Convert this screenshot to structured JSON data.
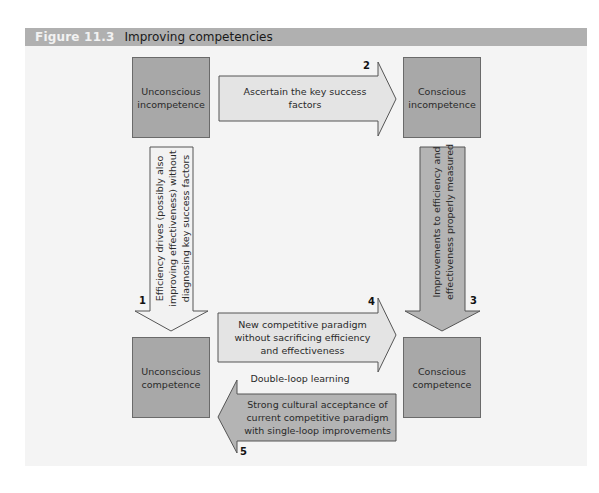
{
  "figure": {
    "number": "Figure 11.3",
    "title": "Improving competencies"
  },
  "boxes": {
    "unconscious_incompetence": "Unconscious incompetence",
    "conscious_incompetence": "Conscious incompetence",
    "unconscious_competence": "Unconscious competence",
    "conscious_competence": "Conscious competence"
  },
  "arrows": [
    {
      "number": "1",
      "label": "Efficiency drives (possibly also improving effectiveness) without diagnosing key success factors",
      "direction": "down"
    },
    {
      "number": "2",
      "label": "Ascertain the key success factors",
      "direction": "right"
    },
    {
      "number": "3",
      "label": "Improvements to efficiency and effectiveness properly measured",
      "direction": "down"
    },
    {
      "number": "4",
      "label": "New competitive paradigm without sacrificing efficiency and effectiveness",
      "direction": "right"
    },
    {
      "number": "5",
      "label": "Strong cultural acceptance of current competitive paradigm with single-loop improvements",
      "direction": "left"
    }
  ],
  "middle_label": "Double-loop learning",
  "colors": {
    "header_bg": "#b0b0b0",
    "panel_bg": "#f4f4f4",
    "box_fill": "#a8a8a8",
    "light_arrow_fill": "#e4e4e4",
    "dark_arrow_fill": "#b4b4b4"
  }
}
